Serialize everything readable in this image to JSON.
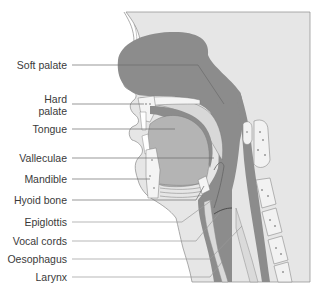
{
  "diagram": {
    "type": "anatomical-sagittal-section",
    "colors": {
      "skin": "#e6e6e6",
      "airway": "#8c8c8c",
      "tongue": "#b4b4b4",
      "bone_fill": "#f2f2f2",
      "outline": "#6e6e6e",
      "label_text": "#3a3a3a"
    },
    "labels": [
      {
        "id": "soft-palate",
        "text": "Soft palate",
        "y": 65
      },
      {
        "id": "hard-palate-1",
        "text": "Hard",
        "y": 99
      },
      {
        "id": "hard-palate-2",
        "text": "palate",
        "y": 111
      },
      {
        "id": "tongue",
        "text": "Tongue",
        "y": 129
      },
      {
        "id": "valleculae",
        "text": "Valleculae",
        "y": 158
      },
      {
        "id": "mandible",
        "text": "Mandible",
        "y": 179
      },
      {
        "id": "hyoid-bone",
        "text": "Hyoid bone",
        "y": 200
      },
      {
        "id": "epiglottis",
        "text": "Epiglottis",
        "y": 222
      },
      {
        "id": "vocal-cords",
        "text": "Vocal cords",
        "y": 241
      },
      {
        "id": "oesophagus",
        "text": "Oesophagus",
        "y": 259
      },
      {
        "id": "larynx",
        "text": "Larynx",
        "y": 277
      }
    ]
  }
}
